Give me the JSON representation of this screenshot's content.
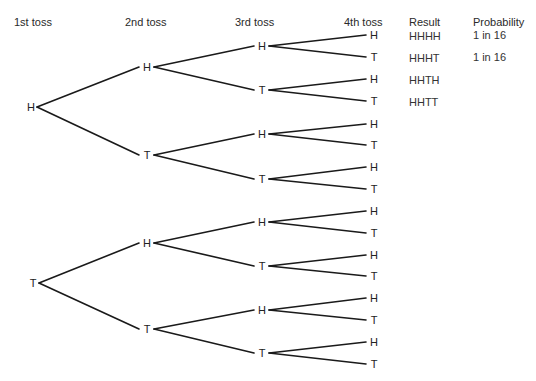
{
  "headers": {
    "toss1": "1st toss",
    "toss2": "2nd toss",
    "toss3": "3rd toss",
    "toss4": "4th toss",
    "result": "Result",
    "probability": "Probability"
  },
  "tree": {
    "level1": [
      "H",
      "T"
    ],
    "level2": [
      "H",
      "T",
      "H",
      "T"
    ],
    "level3": [
      "H",
      "T",
      "H",
      "T",
      "H",
      "T",
      "H",
      "T"
    ],
    "level4": [
      "H",
      "T",
      "H",
      "T",
      "H",
      "T",
      "H",
      "T",
      "H",
      "T",
      "H",
      "T",
      "H",
      "T",
      "H",
      "T"
    ]
  },
  "results": [
    "HHHH",
    "HHHT",
    "HHTH",
    "HHTT"
  ],
  "probabilities": [
    "1 in 16",
    "1 in 16"
  ],
  "colors": {
    "line": "#1a1a1a",
    "text": "#222222"
  }
}
